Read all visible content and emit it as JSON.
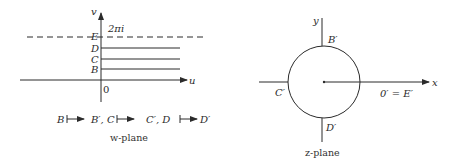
{
  "w_plane": {
    "caption": "w-plane",
    "axis_u_label": "u",
    "axis_v_label": "v",
    "origin_label": "0",
    "dashed_line_label": "E",
    "dashed_line_value": "2πi",
    "lines": [
      {
        "label": "D"
      },
      {
        "label": "C"
      },
      {
        "label": "B"
      }
    ],
    "mapping": {
      "m1_from": "B",
      "m1_to": "B′, C",
      "m2_to": "C′, D",
      "m3_to": "D′"
    }
  },
  "z_plane": {
    "caption": "z-plane",
    "axis_x_label": "x",
    "axis_y_label": "y",
    "top_label": "B′",
    "left_label": "C′",
    "bottom_label": "D′",
    "right_label": "0′ = E′"
  },
  "colors": {
    "stroke": "#2b2b2b",
    "background": "#ffffff"
  }
}
